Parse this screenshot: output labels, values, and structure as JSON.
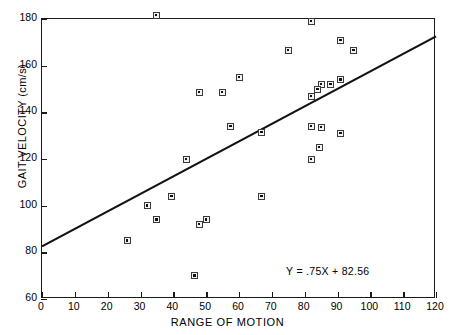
{
  "chart_data": {
    "type": "scatter",
    "title": "",
    "xlabel": "RANGE OF MOTION",
    "ylabel": "GAIT VELOCITY (cm/s)",
    "xlim": [
      0,
      120
    ],
    "ylim": [
      60,
      180
    ],
    "xticks": [
      0,
      10,
      20,
      30,
      40,
      50,
      60,
      70,
      80,
      90,
      100,
      110,
      120
    ],
    "yticks": [
      60,
      80,
      100,
      120,
      140,
      160,
      180
    ],
    "xtick_labels": [
      "0",
      "10",
      "20",
      "30",
      "40",
      "50",
      "60",
      "70",
      "80",
      "90",
      "100",
      "110",
      "120"
    ],
    "ytick_labels": [
      "60",
      "80",
      "100",
      "120",
      "140",
      "160",
      "180"
    ],
    "grid": false,
    "legend": null,
    "marker": "square-with-center-dot",
    "points": [
      {
        "x": 34.8,
        "y": 181.5
      },
      {
        "x": 82.0,
        "y": 179.0
      },
      {
        "x": 75.0,
        "y": 166.5
      },
      {
        "x": 91.0,
        "y": 171.0
      },
      {
        "x": 95.0,
        "y": 166.5
      },
      {
        "x": 60.0,
        "y": 155.0
      },
      {
        "x": 91.0,
        "y": 154.0
      },
      {
        "x": 85.0,
        "y": 152.0
      },
      {
        "x": 88.0,
        "y": 152.0
      },
      {
        "x": 84.0,
        "y": 150.0
      },
      {
        "x": 82.0,
        "y": 147.0
      },
      {
        "x": 48.0,
        "y": 148.5
      },
      {
        "x": 55.0,
        "y": 148.5
      },
      {
        "x": 57.5,
        "y": 134.0
      },
      {
        "x": 67.0,
        "y": 131.5
      },
      {
        "x": 82.0,
        "y": 134.0
      },
      {
        "x": 85.0,
        "y": 133.5
      },
      {
        "x": 91.0,
        "y": 131.0
      },
      {
        "x": 84.5,
        "y": 125.0
      },
      {
        "x": 82.0,
        "y": 120.0
      },
      {
        "x": 44.0,
        "y": 120.0
      },
      {
        "x": 67.0,
        "y": 104.0
      },
      {
        "x": 39.5,
        "y": 104.0
      },
      {
        "x": 32.0,
        "y": 100.0
      },
      {
        "x": 35.0,
        "y": 94.0
      },
      {
        "x": 50.0,
        "y": 94.0
      },
      {
        "x": 48.0,
        "y": 92.0
      },
      {
        "x": 26.0,
        "y": 85.0
      },
      {
        "x": 46.5,
        "y": 70.0
      }
    ],
    "fit_line": {
      "equation_text": "Y = .75X + 82.56",
      "slope": 0.75,
      "intercept": 82.56,
      "x_start": 0,
      "x_end": 120,
      "y_start": 82.56,
      "y_end": 172.56,
      "color": "#111111"
    },
    "annotation": {
      "text": "Y = .75X + 82.56",
      "x_data": 92,
      "y_data": 71.5
    },
    "colors": {
      "axis": "#1a1a1a",
      "marker_face": "#f2f2f2",
      "marker_edge": "#3a3a3a",
      "line": "#111111",
      "background": "#ffffff"
    }
  }
}
